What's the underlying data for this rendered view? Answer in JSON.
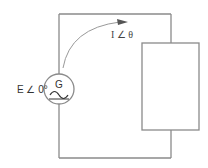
{
  "diagram": {
    "type": "ac-circuit",
    "source": {
      "symbol_letter": "G",
      "label": "E ∠ 0°",
      "kind": "ac-generator"
    },
    "current": {
      "label": "I ∠ θ",
      "direction": "clockwise"
    },
    "load": {
      "kind": "impedance-box",
      "label": ""
    },
    "colors": {
      "wire": "#8a8a8a",
      "text": "#333333"
    }
  }
}
